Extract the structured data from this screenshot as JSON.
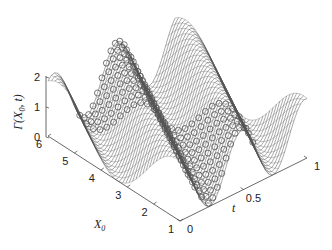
{
  "chart_data": {
    "type": "surface3d",
    "title": "",
    "zlabel": "Γ(X₀, t)",
    "xlabel": "X₀",
    "ylabel": "t",
    "x_axis": {
      "name": "X0",
      "range": [
        1,
        6
      ],
      "ticks": [
        1,
        2,
        3,
        4,
        5,
        6
      ],
      "tick_labels": [
        "1",
        "2",
        "3",
        "4",
        "5",
        "6"
      ]
    },
    "y_axis": {
      "name": "t",
      "range": [
        0,
        1
      ],
      "ticks": [
        0,
        0.5,
        1
      ],
      "tick_labels": [
        "0",
        "0.5",
        "1"
      ]
    },
    "z_axis": {
      "name": "Gamma",
      "range": [
        0,
        2
      ],
      "ticks": [
        0,
        1,
        2
      ],
      "tick_labels": [
        "0",
        "1",
        "2"
      ]
    },
    "grid": false,
    "legend": null,
    "surface": {
      "style": "mesh",
      "color": "#555555",
      "description": "Oscillating wave surface with values between 0 and 2, centered around 1; ridges run diagonally across X0 and t.",
      "formula_approx": "1 + cos(2*pi*t*2 - (X0-1)*0.45*pi)",
      "x_samples": 40,
      "y_samples": 40
    },
    "markers": {
      "style": "circle",
      "color": "#555555",
      "description": "Open circle markers overlay the central band of the surface (t roughly 0.25–0.6)",
      "t_range": [
        0.25,
        0.6
      ]
    }
  },
  "labels": {
    "z_axis_label": "Γ(X",
    "z_axis_sub": "0",
    "z_axis_tail": ", t)",
    "x_axis_label": "X",
    "x_axis_sub": "0",
    "t_axis_label": "t"
  }
}
